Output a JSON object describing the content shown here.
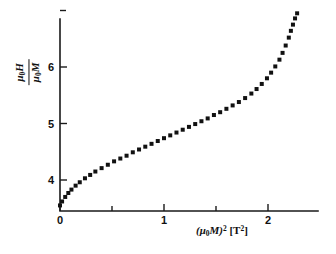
{
  "chart_data": {
    "type": "scatter",
    "title": "",
    "xlabel": "(μ₀M)² [T²]",
    "ylabel": "μ₀H / μ₀M",
    "ylabel_numerator": "μ₀H",
    "ylabel_denominator": "μ₀M",
    "xlim": [
      0,
      2.45
    ],
    "ylim": [
      3.4,
      7.05
    ],
    "grid": false,
    "legend": null,
    "marker": "square",
    "marker_color": "#111111",
    "x_major_ticks": [
      0,
      1,
      2
    ],
    "x_major_tick_labels": [
      "0",
      "1",
      "2"
    ],
    "x_minor_ticks": [
      0.5,
      1.5
    ],
    "y_major_ticks": [
      4,
      5,
      6
    ],
    "y_major_tick_labels": [
      "4",
      "5",
      "6"
    ],
    "y_minor_ticks": [
      7
    ],
    "x": [
      0.0,
      0.02,
      0.05,
      0.08,
      0.11,
      0.15,
      0.19,
      0.24,
      0.29,
      0.34,
      0.4,
      0.46,
      0.52,
      0.58,
      0.64,
      0.7,
      0.76,
      0.82,
      0.88,
      0.94,
      1.0,
      1.06,
      1.12,
      1.18,
      1.24,
      1.3,
      1.36,
      1.42,
      1.48,
      1.54,
      1.6,
      1.66,
      1.72,
      1.78,
      1.84,
      1.89,
      1.94,
      1.99,
      2.03,
      2.07,
      2.11,
      2.14,
      2.17,
      2.2,
      2.22,
      2.24,
      2.26,
      2.28
    ],
    "y": [
      3.55,
      3.62,
      3.7,
      3.77,
      3.83,
      3.9,
      3.96,
      4.03,
      4.09,
      4.15,
      4.21,
      4.27,
      4.33,
      4.38,
      4.43,
      4.49,
      4.54,
      4.59,
      4.64,
      4.69,
      4.74,
      4.79,
      4.84,
      4.89,
      4.94,
      4.99,
      5.04,
      5.09,
      5.15,
      5.2,
      5.26,
      5.32,
      5.38,
      5.45,
      5.53,
      5.61,
      5.7,
      5.8,
      5.9,
      6.01,
      6.13,
      6.25,
      6.38,
      6.52,
      6.64,
      6.75,
      6.86,
      6.95
    ]
  },
  "axes": {
    "x_tick_labels": [
      "0",
      "1",
      "2"
    ],
    "y_tick_labels": [
      "4",
      "5",
      "6"
    ]
  },
  "xlabel": {
    "base": "(μ",
    "sub": "0",
    "mid": "M)",
    "sup": "2",
    "unit": " [T",
    "unit_sup": "2",
    "unit_end": "]"
  }
}
